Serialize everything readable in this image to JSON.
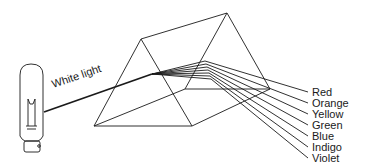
{
  "diagram": {
    "beam_label": "White light",
    "colors": [
      {
        "label": "Red",
        "y": 92
      },
      {
        "label": "Orange",
        "y": 103
      },
      {
        "label": "Yellow",
        "y": 114
      },
      {
        "label": "Green",
        "y": 125
      },
      {
        "label": "Blue",
        "y": 136
      },
      {
        "label": "Indigo",
        "y": 147
      },
      {
        "label": "Violet",
        "y": 158
      }
    ],
    "stroke_color": "#1a1a1a",
    "background": "#ffffff"
  }
}
